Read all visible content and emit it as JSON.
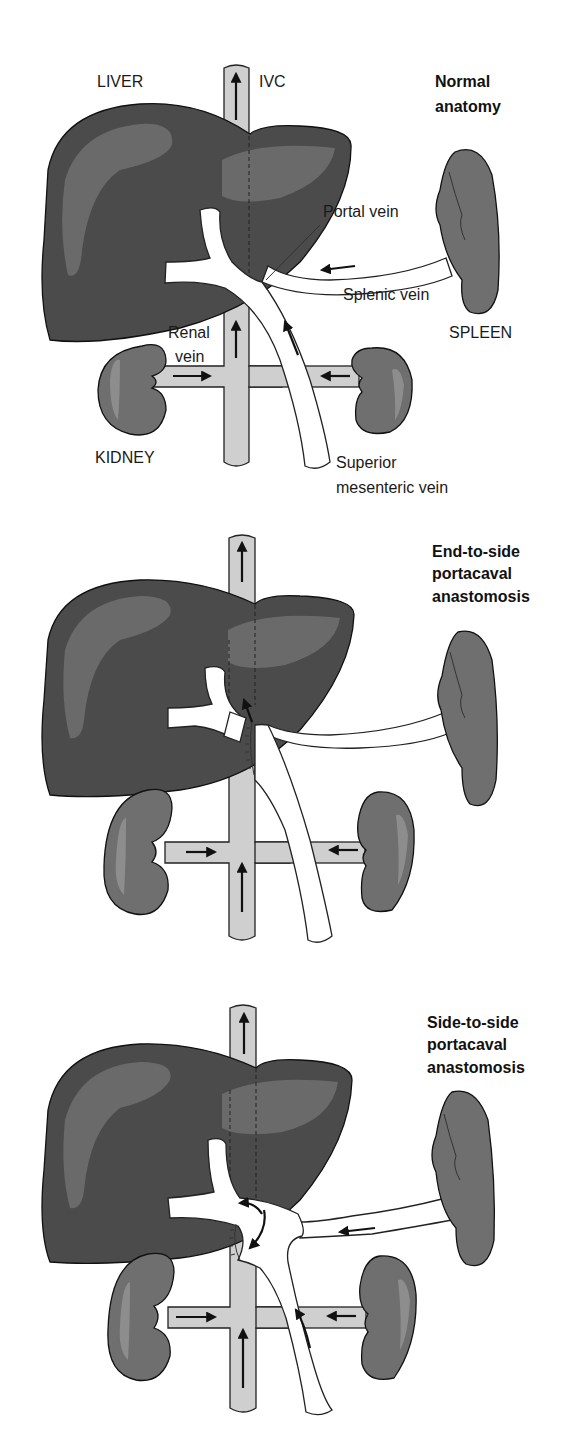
{
  "figure": {
    "panels": [
      {
        "id": "normal",
        "title_lines": [
          "Normal",
          "anatomy"
        ],
        "labels": {
          "liver": "LIVER",
          "ivc": "IVC",
          "portal_vein": "Portal vein",
          "splenic_vein": "Splenic vein",
          "spleen": "SPLEEN",
          "renal_vein_line1": "Renal",
          "renal_vein_line2": "vein",
          "kidney": "KIDNEY",
          "smv_line1": "Superior",
          "smv_line2": "mesenteric vein"
        }
      },
      {
        "id": "end-to-side",
        "title_lines": [
          "End-to-side",
          "portacaval",
          "anastomosis"
        ]
      },
      {
        "id": "side-to-side",
        "title_lines": [
          "Side-to-side",
          "portacaval",
          "anastomosis"
        ]
      }
    ],
    "colors": {
      "liver": "#4b4b4b",
      "ivc": "#cfcfcf",
      "organ": "#6f6f6f",
      "vein": "#ffffff"
    }
  }
}
